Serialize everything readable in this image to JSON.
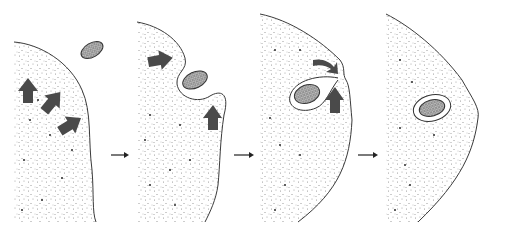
{
  "diagram": {
    "title": "Phagocytosis sequence",
    "panels": [
      {
        "step": 1,
        "label": "Particle approaches cell; cytoplasm extends toward it"
      },
      {
        "step": 2,
        "label": "Pseudopods surround the particle"
      },
      {
        "step": 3,
        "label": "Membrane closes around the particle"
      },
      {
        "step": 4,
        "label": "Particle enclosed in a vacuole inside the cell"
      }
    ],
    "transition_arrows": 3,
    "colors": {
      "membrane": "#3a3a3a",
      "cytoplasm_speckle": "#8a8a8a",
      "motion_arrow": "#4a4a4a",
      "background": "#ffffff"
    }
  }
}
